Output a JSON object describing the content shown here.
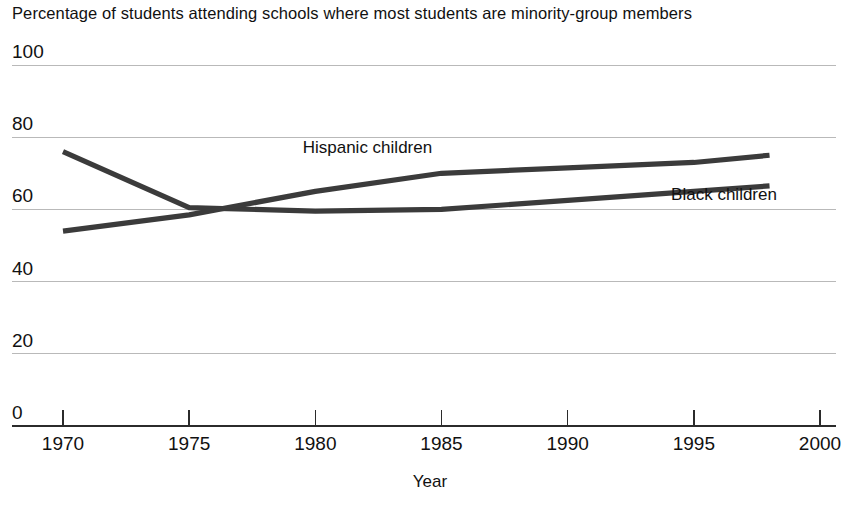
{
  "chart_data": {
    "type": "line",
    "title": "Percentage of students attending schools where most students are minority-group members",
    "xlabel": "Year",
    "ylabel": "",
    "xlim": [
      1970,
      2000
    ],
    "ylim": [
      0,
      100
    ],
    "xticks": [
      1970,
      1975,
      1980,
      1985,
      1990,
      1995,
      2000
    ],
    "xtick_labels": [
      "1970",
      "1975",
      "1980",
      "1985",
      "1990",
      "1995",
      "2000"
    ],
    "yticks": [
      0,
      20,
      40,
      60,
      80,
      100
    ],
    "ytick_labels": [
      "0",
      "20",
      "40",
      "60",
      "80",
      "100"
    ],
    "grid": "horizontal",
    "legend_position": "inline-annotations",
    "line_color": "#3b3b3b",
    "series": [
      {
        "name": "Black children",
        "label": "Black children",
        "label_x": 1994.1,
        "label_y": 62.5,
        "color": "#3b3b3b",
        "x": [
          1970,
          1975,
          1980,
          1985,
          1990,
          1995,
          1998
        ],
        "values": [
          76,
          60.5,
          59.5,
          60,
          62.5,
          65,
          66.5
        ]
      },
      {
        "name": "Hispanic children",
        "label": "Hispanic children",
        "label_x": 1979.5,
        "label_y": 75.5,
        "color": "#3b3b3b",
        "x": [
          1970,
          1975,
          1980,
          1985,
          1990,
          1995,
          1998
        ],
        "values": [
          54,
          58.5,
          65,
          70,
          71.5,
          73,
          75
        ]
      }
    ]
  }
}
